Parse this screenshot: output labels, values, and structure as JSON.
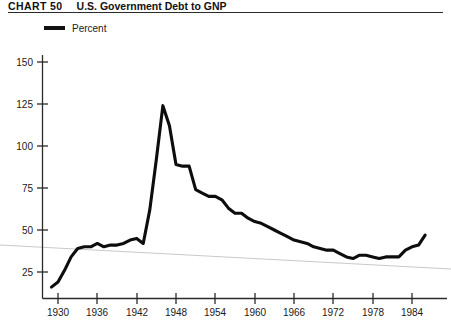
{
  "header": {
    "chart_number": "CHART 50",
    "title": "U.S. Government Debt to GNP"
  },
  "legend": {
    "position": "top-left",
    "entries": [
      {
        "label": "Percent",
        "color": "#0d0d0d"
      }
    ]
  },
  "axes": {
    "y_ticks": [
      "25",
      "50",
      "75",
      "100",
      "125",
      "150"
    ],
    "x_ticks": [
      "1930",
      "1936",
      "1942",
      "1948",
      "1954",
      "1960",
      "1966",
      "1972",
      "1978",
      "1984"
    ]
  },
  "chart_data": {
    "type": "line",
    "title": "U.S. Government Debt to GNP",
    "subtitle": "CHART 50",
    "xlabel": "",
    "ylabel": "Percent",
    "xlim": [
      1929,
      1986
    ],
    "ylim": [
      0,
      160
    ],
    "grid": false,
    "legend_position": "top-left",
    "series": [
      {
        "name": "Percent",
        "color": "#0d0d0d",
        "x": [
          1929,
          1930,
          1931,
          1932,
          1933,
          1934,
          1935,
          1936,
          1937,
          1938,
          1939,
          1940,
          1941,
          1942,
          1943,
          1944,
          1945,
          1946,
          1947,
          1948,
          1949,
          1950,
          1951,
          1952,
          1953,
          1954,
          1955,
          1956,
          1957,
          1958,
          1959,
          1960,
          1961,
          1962,
          1963,
          1964,
          1965,
          1966,
          1967,
          1968,
          1969,
          1970,
          1971,
          1972,
          1973,
          1974,
          1975,
          1976,
          1977,
          1978,
          1979,
          1980,
          1981,
          1982,
          1983,
          1984,
          1985,
          1986
        ],
        "values": [
          16,
          19,
          26,
          34,
          39,
          40,
          40,
          42,
          40,
          41,
          41,
          42,
          44,
          45,
          42,
          62,
          92,
          124,
          112,
          89,
          88,
          88,
          74,
          72,
          70,
          70,
          68,
          63,
          60,
          60,
          57,
          55,
          54,
          52,
          50,
          48,
          46,
          44,
          43,
          42,
          40,
          39,
          38,
          38,
          36,
          34,
          33,
          35,
          35,
          34,
          33,
          34,
          34,
          34,
          38,
          40,
          41,
          47
        ]
      }
    ],
    "annotations": [
      {
        "text": "WWII peak",
        "x": 1946,
        "y": 124,
        "visible": false
      }
    ]
  }
}
